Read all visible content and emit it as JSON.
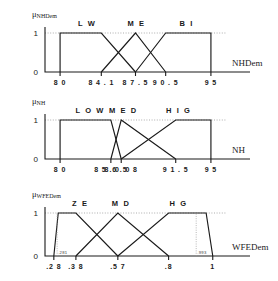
{
  "figure": {
    "type": "fuzzy-membership-function-figure",
    "panel_count": 3
  },
  "chart_data": [
    {
      "type": "line",
      "title": "",
      "ylabel": "μNHDem",
      "ylabel_main": "μ",
      "ylabel_sub": "NHDem",
      "xlabel": "NHDem",
      "xlim": [
        78.5,
        96.5
      ],
      "ylim": [
        0,
        1
      ],
      "yticks": [
        0,
        1
      ],
      "ytick_labels": [
        "0",
        "1"
      ],
      "xticks": [
        80,
        84.1,
        87.5,
        90.5,
        95
      ],
      "xtick_labels": [
        "8 0",
        "8 4 . 1",
        "8 7 . 5",
        "9 0 . 5",
        "9 5"
      ],
      "grid": false,
      "legend": "inline-labels",
      "series": [
        {
          "name": "LW",
          "label": "L W",
          "label_x": 82.7,
          "points": [
            [
              80,
              0
            ],
            [
              80,
              1
            ],
            [
              84.1,
              1
            ],
            [
              87.5,
              0
            ]
          ]
        },
        {
          "name": "ME",
          "label": "M E",
          "label_x": 87.6,
          "points": [
            [
              84.1,
              0
            ],
            [
              87.5,
              1
            ],
            [
              90.5,
              0
            ]
          ]
        },
        {
          "name": "BI",
          "label": "B I",
          "label_x": 92.6,
          "points": [
            [
              87.5,
              0
            ],
            [
              90.5,
              1
            ],
            [
              95,
              1
            ],
            [
              95,
              0
            ]
          ]
        }
      ]
    },
    {
      "type": "line",
      "title": "",
      "ylabel": "μNH",
      "ylabel_main": "μ",
      "ylabel_sub": "NH",
      "xlabel": "NH",
      "xlim": [
        78.5,
        96.5
      ],
      "ylim": [
        0,
        1
      ],
      "yticks": [
        0,
        1
      ],
      "ytick_labels": [
        "0",
        "1"
      ],
      "xticks": [
        80,
        85.05,
        86.08,
        91.5,
        95
      ],
      "xtick_labels": [
        "8 0",
        "8 5 . 0 5",
        "8 6 . 0 8",
        "9 1 . 5",
        "9 5"
      ],
      "grid": false,
      "legend": "inline-labels",
      "series": [
        {
          "name": "LOW",
          "label": "L O W",
          "label_x": 83.0,
          "points": [
            [
              80,
              0
            ],
            [
              80,
              1
            ],
            [
              85.05,
              1
            ],
            [
              86.08,
              0
            ]
          ]
        },
        {
          "name": "MED",
          "label": "M E D",
          "label_x": 86.3,
          "points": [
            [
              85.05,
              0
            ],
            [
              86.08,
              1
            ],
            [
              91.5,
              0
            ]
          ]
        },
        {
          "name": "HIG",
          "label": "H I G",
          "label_x": 91.8,
          "points": [
            [
              86.08,
              0
            ],
            [
              91.5,
              1
            ],
            [
              95,
              1
            ],
            [
              95,
              0
            ]
          ]
        }
      ]
    },
    {
      "type": "line",
      "title": "",
      "ylabel": "μWFEDem",
      "ylabel_main": "μ",
      "ylabel_sub": "WFEDem",
      "xlabel": "WFEDem",
      "xlim": [
        0.24,
        1.06
      ],
      "ylim": [
        0,
        1
      ],
      "yticks": [
        0,
        1
      ],
      "ytick_labels": [
        "0",
        "1"
      ],
      "xticks": [
        0.28,
        0.38,
        0.57,
        0.8,
        1.0
      ],
      "xtick_labels": [
        ".2 8",
        ".3 8",
        ".5 7",
        ".8",
        "1"
      ],
      "grid": false,
      "legend": "inline-labels",
      "annotations": [
        {
          "text": ".281",
          "x": 0.295,
          "y": 0.08
        },
        {
          "text": ".993",
          "x": 0.925,
          "y": 0.08
        }
      ],
      "series": [
        {
          "name": "ZE",
          "label": "Z E",
          "label_x": 0.4,
          "points": [
            [
              0.28,
              0
            ],
            [
              0.3,
              1
            ],
            [
              0.38,
              1
            ],
            [
              0.57,
              0
            ]
          ]
        },
        {
          "name": "MD",
          "label": "M D",
          "label_x": 0.585,
          "points": [
            [
              0.38,
              0
            ],
            [
              0.57,
              1
            ],
            [
              0.8,
              0
            ]
          ]
        },
        {
          "name": "HG",
          "label": "H G",
          "label_x": 0.845,
          "points": [
            [
              0.57,
              0
            ],
            [
              0.8,
              1
            ],
            [
              0.97,
              1
            ],
            [
              1.0,
              0
            ]
          ]
        }
      ]
    }
  ]
}
